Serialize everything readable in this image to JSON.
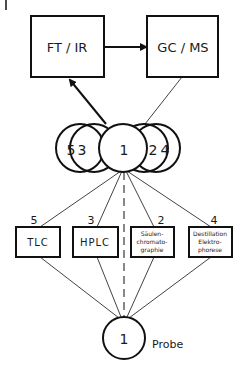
{
  "diagram": {
    "top_boxes": [
      {
        "id": "ftir",
        "label": "FT / IR"
      },
      {
        "id": "gcms",
        "label": "GC / MS"
      }
    ],
    "fraction_circles": {
      "labels": [
        "5",
        "3",
        "1",
        "2",
        "4"
      ]
    },
    "methods": [
      {
        "id": "tlc",
        "number": "5",
        "lines": [
          "TLC"
        ]
      },
      {
        "id": "hplc",
        "number": "3",
        "lines": [
          "HPLC"
        ]
      },
      {
        "id": "saeulen",
        "number": "2",
        "lines": [
          "Säulen-",
          "chromato-",
          "graphie"
        ]
      },
      {
        "id": "destillation",
        "number": "4",
        "lines": [
          "Destillation",
          "Elektro-",
          "phorese"
        ]
      }
    ],
    "sample": {
      "number": "1",
      "label": "Probe"
    }
  },
  "colors": {
    "stroke": "#111111",
    "background": "#ffffff"
  }
}
